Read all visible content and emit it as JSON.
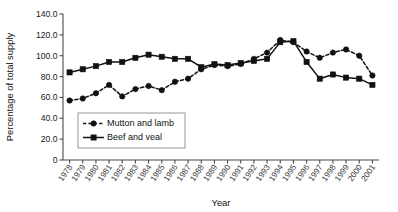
{
  "chart_data": {
    "type": "line",
    "title": "",
    "xlabel": "Year",
    "ylabel": "Percentage of total supply",
    "x": [
      "1978",
      "1979",
      "1980",
      "1981",
      "1982",
      "1983",
      "1984",
      "1985",
      "1986",
      "1987",
      "1988",
      "1989",
      "1990",
      "1991",
      "1992",
      "1993",
      "1994",
      "1995",
      "1996",
      "1997",
      "1998",
      "1999",
      "2000",
      "2001"
    ],
    "categories": [
      "1978",
      "1979",
      "1980",
      "1981",
      "1982",
      "1983",
      "1984",
      "1985",
      "1986",
      "1987",
      "1988",
      "1989",
      "1990",
      "1991",
      "1992",
      "1993",
      "1994",
      "1995",
      "1996",
      "1997",
      "1998",
      "1999",
      "2000",
      "2001"
    ],
    "ylim": [
      0,
      140
    ],
    "ytick_labels": [
      "0",
      "20.0",
      "40.0",
      "60.0",
      "80.0",
      "100.0",
      "120.0",
      "140.0"
    ],
    "ytick_values": [
      0,
      20,
      40,
      60,
      80,
      100,
      120,
      140
    ],
    "grid": false,
    "legend_position": "inside-lower-left",
    "series": [
      {
        "name": "Mutton and lamb",
        "marker": "circle",
        "line_style": "dashed",
        "color": "#111111",
        "values": [
          57,
          59,
          64,
          72,
          61,
          68,
          71,
          67,
          75,
          78,
          87,
          91,
          90,
          92,
          97,
          103,
          115,
          113,
          104,
          98,
          103,
          106,
          100,
          81
        ]
      },
      {
        "name": "Beef and veal",
        "marker": "square",
        "line_style": "solid",
        "color": "#111111",
        "values": [
          84,
          87,
          90,
          94,
          94,
          98,
          101,
          99,
          97,
          97,
          89,
          92,
          91,
          93,
          95,
          97,
          113,
          114,
          94,
          78,
          82,
          79,
          78,
          72
        ]
      }
    ]
  },
  "legend": {
    "items": [
      {
        "label": "Mutton and lamb"
      },
      {
        "label": "Beef and veal"
      }
    ]
  }
}
